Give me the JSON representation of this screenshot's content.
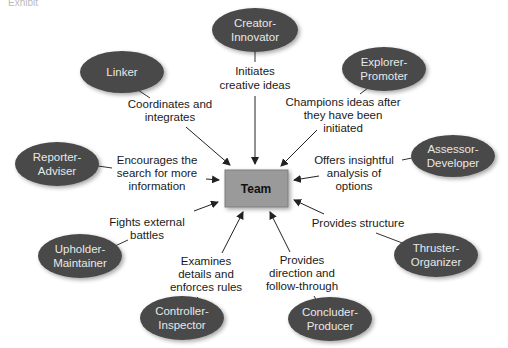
{
  "header": {
    "exhibit_label": "Exhibit"
  },
  "center": {
    "label": "Team",
    "fill": "#9a9a9a"
  },
  "colors": {
    "node_fill": "#4a4a4a",
    "node_text": "#e8e8e8",
    "arrow": "#222222"
  },
  "roles": [
    {
      "id": "creator-innovator",
      "line1": "Creator-",
      "line2": "Innovator",
      "desc": [
        "Initiates",
        "creative ideas"
      ]
    },
    {
      "id": "linker",
      "line1": "Linker",
      "line2": "",
      "desc": [
        "Coordinates and",
        "integrates"
      ]
    },
    {
      "id": "explorer-promoter",
      "line1": "Explorer-",
      "line2": "Promoter",
      "desc": [
        "Champions ideas after",
        "they have been",
        "initiated"
      ]
    },
    {
      "id": "reporter-adviser",
      "line1": "Reporter-",
      "line2": "Adviser",
      "desc": [
        "Encourages the",
        "search for more",
        "information"
      ]
    },
    {
      "id": "assessor-developer",
      "line1": "Assessor-",
      "line2": "Developer",
      "desc": [
        "Offers insightful",
        "analysis of",
        "options"
      ]
    },
    {
      "id": "upholder-maintainer",
      "line1": "Upholder-",
      "line2": "Maintainer",
      "desc": [
        "Fights external",
        "battles"
      ]
    },
    {
      "id": "thruster-organizer",
      "line1": "Thruster-",
      "line2": "Organizer",
      "desc": [
        "Provides structure"
      ]
    },
    {
      "id": "controller-inspector",
      "line1": "Controller-",
      "line2": "Inspector",
      "desc": [
        "Examines",
        "details and",
        "enforces rules"
      ]
    },
    {
      "id": "concluder-producer",
      "line1": "Concluder-",
      "line2": "Producer",
      "desc": [
        "Provides",
        "direction and",
        "follow-through"
      ]
    }
  ]
}
